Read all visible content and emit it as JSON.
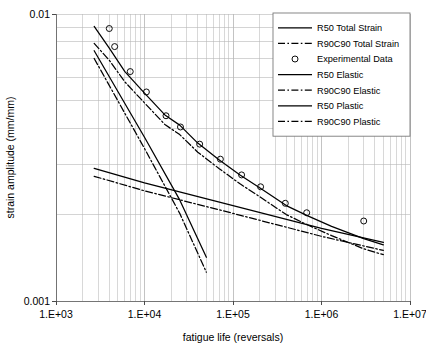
{
  "chart_data": {
    "type": "line",
    "title": "",
    "xlabel": "fatigue life (reversals)",
    "ylabel": "strain amplitude (mm/mm)",
    "xscale": "log",
    "yscale": "log",
    "xlim": [
      1000,
      10000000
    ],
    "ylim": [
      0.001,
      0.01
    ],
    "xticks": [
      "1.E+03",
      "1.E+04",
      "1.E+05",
      "1.E+06",
      "1.E+07"
    ],
    "xtick_values": [
      1000,
      10000,
      100000,
      1000000,
      10000000
    ],
    "yticks": [
      "0.01",
      "0.001"
    ],
    "ytick_values": [
      0.01,
      0.001
    ],
    "grid": "minor-log-both",
    "legend_position": "top-right",
    "series": [
      {
        "name": "R50 Total Strain",
        "style": "solid",
        "x": [
          2700,
          4000,
          6000,
          10000,
          17000,
          25000,
          40000,
          70000,
          120000,
          200000,
          400000,
          700000,
          1300000,
          3000000,
          5000000
        ],
        "y": [
          0.00905,
          0.0076,
          0.0063,
          0.0053,
          0.00445,
          0.0041,
          0.00355,
          0.0031,
          0.00275,
          0.00248,
          0.00215,
          0.00198,
          0.00182,
          0.00165,
          0.00157
        ]
      },
      {
        "name": "R90C90 Total Strain",
        "style": "dash-dot",
        "x": [
          2700,
          4000,
          6000,
          10000,
          17000,
          25000,
          40000,
          70000,
          120000,
          200000,
          400000,
          700000,
          1300000,
          3000000,
          5000000
        ],
        "y": [
          0.0079,
          0.0069,
          0.0058,
          0.0049,
          0.00412,
          0.0038,
          0.0033,
          0.00289,
          0.00256,
          0.00231,
          0.002,
          0.00184,
          0.00169,
          0.00152,
          0.00145
        ]
      },
      {
        "name": "R50 Elastic",
        "style": "solid",
        "x": [
          2700,
          10000,
          100000,
          1000000,
          5000000
        ],
        "y": [
          0.0029,
          0.00258,
          0.00215,
          0.00179,
          0.0016
        ]
      },
      {
        "name": "R90C90 Elastic",
        "style": "dash-dot",
        "x": [
          2700,
          10000,
          100000,
          1000000,
          5000000
        ],
        "y": [
          0.00272,
          0.00242,
          0.00202,
          0.00168,
          0.0015
        ]
      },
      {
        "name": "R50 Plastic",
        "style": "solid",
        "x": [
          2700,
          10000,
          25000,
          50000
        ],
        "y": [
          0.00745,
          0.00372,
          0.00225,
          0.00142
        ]
      },
      {
        "name": "R90C90 Plastic",
        "style": "dash-dot",
        "x": [
          2700,
          10000,
          25000,
          50000
        ],
        "y": [
          0.007,
          0.0034,
          0.00202,
          0.00126
        ]
      }
    ],
    "scatter": {
      "name": "Experimental Data",
      "marker": "open-circle",
      "x": [
        4000,
        4600,
        6900,
        10500,
        17500,
        25500,
        42000,
        72000,
        125000,
        205000,
        390000,
        680000,
        3000000
      ],
      "y": [
        0.0089,
        0.0077,
        0.0063,
        0.00535,
        0.00442,
        0.00404,
        0.00352,
        0.00312,
        0.00275,
        0.0025,
        0.00219,
        0.00203,
        0.0019
      ]
    },
    "legend": [
      {
        "label": "R50 Total Strain",
        "style": "solid"
      },
      {
        "label": "R90C90 Total Strain",
        "style": "dash-dot"
      },
      {
        "label": "Experimental Data",
        "style": "marker"
      },
      {
        "label": "R50 Elastic",
        "style": "solid"
      },
      {
        "label": "R90C90 Elastic",
        "style": "dash-dot"
      },
      {
        "label": "R50 Plastic",
        "style": "solid"
      },
      {
        "label": "R90C90 Plastic",
        "style": "dash-dot"
      }
    ],
    "colors": {
      "line": "#000000",
      "grid": "#b8b8b8",
      "axis": "#555555",
      "background": "#ffffff"
    }
  }
}
